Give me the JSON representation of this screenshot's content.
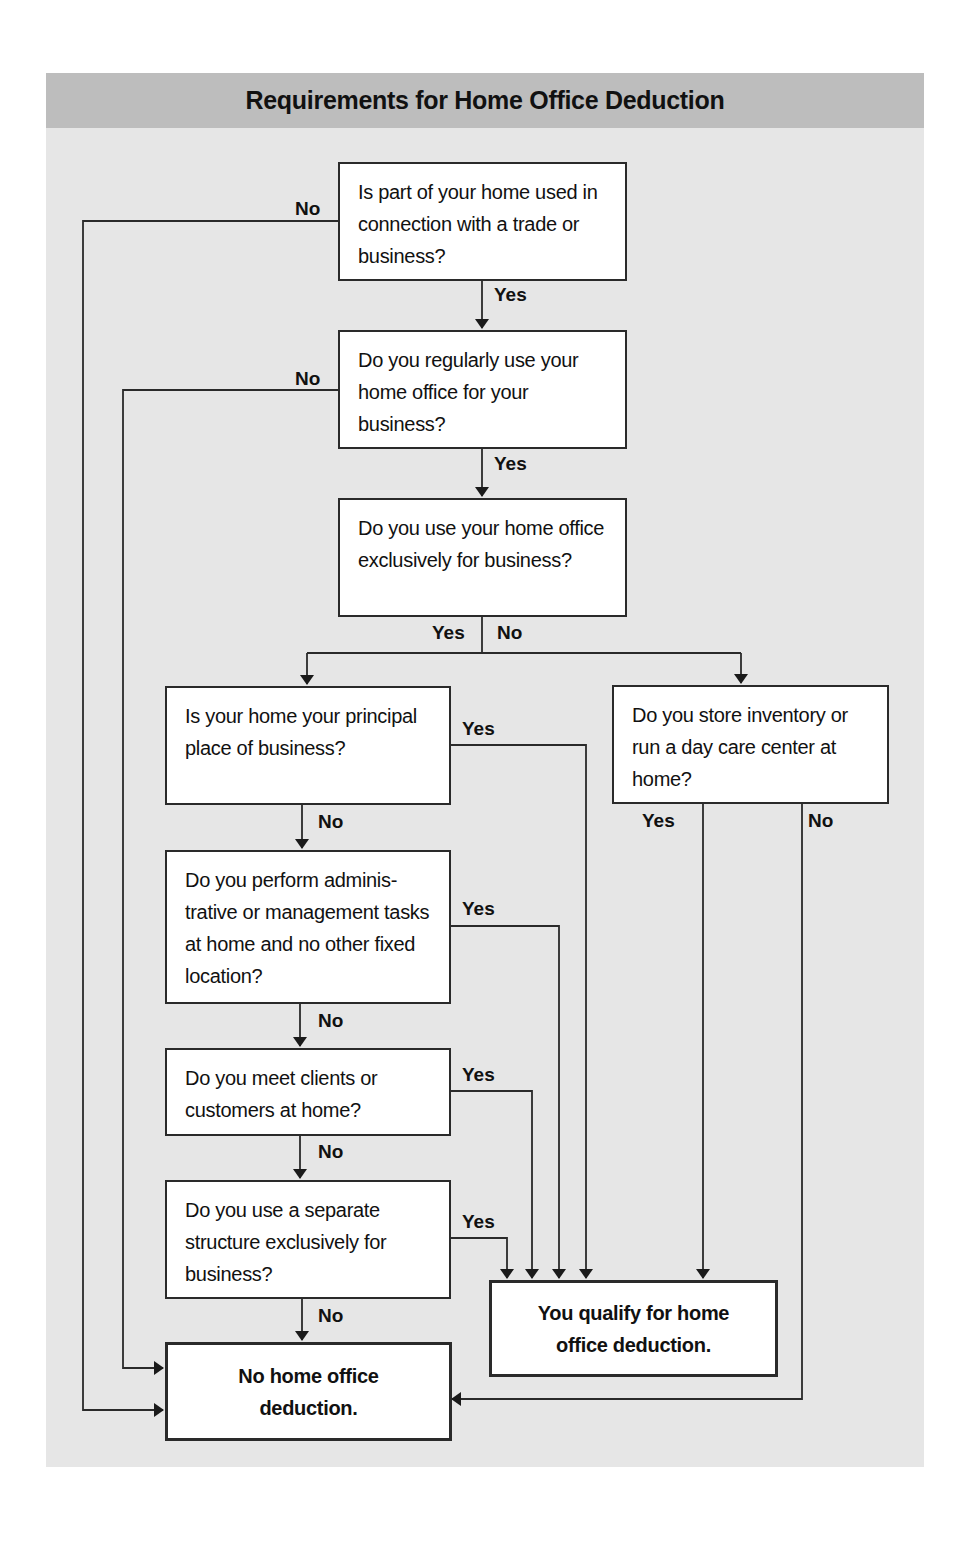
{
  "title": "Requirements for Home Office Deduction",
  "nodes": {
    "q1": {
      "text": "Is part of your home used in connection with a trade or business?"
    },
    "q2": {
      "text": "Do you regularly use your home office for your business?"
    },
    "q3": {
      "text": "Do you use your home office exclusively for business?"
    },
    "q4": {
      "text": "Is your home your principal place of business?"
    },
    "q5": {
      "text": "Do you store inventory or run a day care center at home?"
    },
    "q6": {
      "text": "Do you perform adminis-trative or management tasks at home and no other fixed location?"
    },
    "q7": {
      "text": "Do you meet clients or customers at home?"
    },
    "q8": {
      "text": "Do you use a separate structure exclusively for business?"
    },
    "qualify": {
      "text": "You qualify for home office deduction."
    },
    "no_deduction": {
      "text": "No home office deduction."
    }
  },
  "edges": [
    {
      "from": "q1",
      "to": "q2",
      "label": "Yes"
    },
    {
      "from": "q1",
      "to": "no_deduction",
      "label": "No"
    },
    {
      "from": "q2",
      "to": "q3",
      "label": "Yes"
    },
    {
      "from": "q2",
      "to": "no_deduction",
      "label": "No"
    },
    {
      "from": "q3",
      "to": "q4",
      "label": "Yes"
    },
    {
      "from": "q3",
      "to": "q5",
      "label": "No"
    },
    {
      "from": "q4",
      "to": "qualify",
      "label": "Yes"
    },
    {
      "from": "q4",
      "to": "q6",
      "label": "No"
    },
    {
      "from": "q5",
      "to": "qualify",
      "label": "Yes"
    },
    {
      "from": "q5",
      "to": "no_deduction",
      "label": "No"
    },
    {
      "from": "q6",
      "to": "qualify",
      "label": "Yes"
    },
    {
      "from": "q6",
      "to": "q7",
      "label": "No"
    },
    {
      "from": "q7",
      "to": "qualify",
      "label": "Yes"
    },
    {
      "from": "q7",
      "to": "q8",
      "label": "No"
    },
    {
      "from": "q8",
      "to": "qualify",
      "label": "Yes"
    },
    {
      "from": "q8",
      "to": "no_deduction",
      "label": "No"
    }
  ],
  "labels": {
    "yes": "Yes",
    "no": "No"
  },
  "colors": {
    "panel": "#e6e6e6",
    "header": "#bdbdbd",
    "line": "#2a2a2a",
    "box": "#ffffff"
  }
}
